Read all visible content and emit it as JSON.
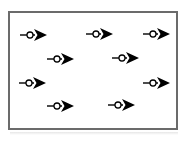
{
  "figure": {
    "title": "",
    "background_color": "#ffffff",
    "frame": {
      "border_color": "#6b6b6b",
      "border_width": 2,
      "x": 8,
      "y": 11,
      "width": 170,
      "height": 119
    }
  },
  "chart_data": {
    "type": "scatter",
    "title": "",
    "subtitle": "",
    "xlabel": "",
    "ylabel": "",
    "xlim": [
      0,
      190
    ],
    "ylim": [
      0,
      143
    ],
    "grid": false,
    "legend": null,
    "annotations": [],
    "tick_labels": {
      "x": [],
      "y": []
    },
    "glyph": {
      "name": "right-pointing-arrow-with-circle",
      "stroke_color": "#000000",
      "fill_color": "#000000",
      "circle_fill": "#ffffff",
      "tail_length": 10,
      "circle_radius": 3,
      "head_length": 13,
      "head_halfwidth": 6,
      "direction_deg": 0
    },
    "series": [
      {
        "name": "arrows",
        "count": 9,
        "points": [
          {
            "id": "arrow-1",
            "row": 1,
            "col": 1,
            "x": 20,
            "y": 35,
            "angle_deg": 0,
            "scale": 1.0
          },
          {
            "id": "arrow-2",
            "row": 1,
            "col": 2,
            "x": 86,
            "y": 34,
            "angle_deg": 0,
            "scale": 1.0
          },
          {
            "id": "arrow-3",
            "row": 1,
            "col": 3,
            "x": 143,
            "y": 34,
            "angle_deg": 0,
            "scale": 1.0
          },
          {
            "id": "arrow-4",
            "row": 2,
            "col": 1,
            "x": 47,
            "y": 59,
            "angle_deg": 0,
            "scale": 1.0
          },
          {
            "id": "arrow-5",
            "row": 2,
            "col": 2,
            "x": 112,
            "y": 58,
            "angle_deg": 0,
            "scale": 1.0
          },
          {
            "id": "arrow-6",
            "row": 3,
            "col": 1,
            "x": 19,
            "y": 83,
            "angle_deg": 0,
            "scale": 1.0
          },
          {
            "id": "arrow-7",
            "row": 3,
            "col": 2,
            "x": 143,
            "y": 83,
            "angle_deg": 0,
            "scale": 1.0
          },
          {
            "id": "arrow-8",
            "row": 4,
            "col": 1,
            "x": 47,
            "y": 106,
            "angle_deg": 0,
            "scale": 1.0
          },
          {
            "id": "arrow-9",
            "row": 4,
            "col": 2,
            "x": 108,
            "y": 105,
            "angle_deg": 0,
            "scale": 1.0
          }
        ]
      }
    ]
  }
}
